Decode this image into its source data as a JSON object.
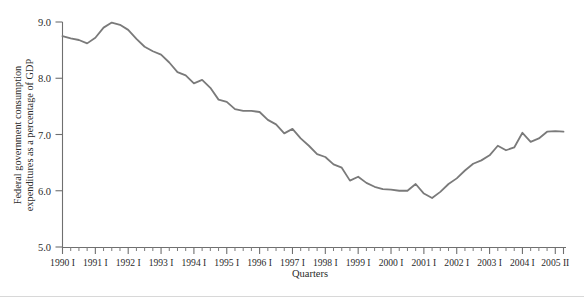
{
  "chart_data": {
    "type": "line",
    "title": "",
    "xlabel": "Quarters",
    "ylabel": "Federal government consumption expenditures as a percentage of GDP",
    "ylabel_line1": "Federal government consumption",
    "ylabel_line2": "expenditures as a percentage of GDP",
    "ylim": [
      5.0,
      9.0
    ],
    "ytick_labels": [
      "5.0",
      "6.0",
      "7.0",
      "8.0",
      "9.0"
    ],
    "ytick_values": [
      5.0,
      6.0,
      7.0,
      8.0,
      9.0
    ],
    "grid": false,
    "legend": "none",
    "line_color": "#7a7a7a",
    "axis_color": "#6f6f6f",
    "xtick_major_labels": [
      "1990 I",
      "1991 I",
      "1992 I",
      "1993 I",
      "1994 I",
      "1995 I",
      "1996 I",
      "1997 I",
      "1998 I",
      "1999 I",
      "2000 I",
      "2001 I",
      "2002 I",
      "2003 I",
      "2004 I",
      "2005 II"
    ],
    "x": [
      "1990 I",
      "1990 II",
      "1990 III",
      "1990 IV",
      "1991 I",
      "1991 II",
      "1991 III",
      "1991 IV",
      "1992 I",
      "1992 II",
      "1992 III",
      "1992 IV",
      "1993 I",
      "1993 II",
      "1993 III",
      "1993 IV",
      "1994 I",
      "1994 II",
      "1994 III",
      "1994 IV",
      "1995 I",
      "1995 II",
      "1995 III",
      "1995 IV",
      "1996 I",
      "1996 II",
      "1996 III",
      "1996 IV",
      "1997 I",
      "1997 II",
      "1997 III",
      "1997 IV",
      "1998 I",
      "1998 II",
      "1998 III",
      "1998 IV",
      "1999 I",
      "1999 II",
      "1999 III",
      "1999 IV",
      "2000 I",
      "2000 II",
      "2000 III",
      "2000 IV",
      "2001 I",
      "2001 II",
      "2001 III",
      "2001 IV",
      "2002 I",
      "2002 II",
      "2002 III",
      "2002 IV",
      "2003 I",
      "2003 II",
      "2003 III",
      "2003 IV",
      "2004 I",
      "2004 II",
      "2004 III",
      "2004 IV",
      "2005 I",
      "2005 II"
    ],
    "values": [
      8.75,
      8.71,
      8.68,
      8.62,
      8.72,
      8.9,
      8.99,
      8.95,
      8.86,
      8.7,
      8.56,
      8.48,
      8.42,
      8.28,
      8.11,
      8.05,
      7.91,
      7.97,
      7.83,
      7.62,
      7.58,
      7.45,
      7.42,
      7.42,
      7.4,
      7.26,
      7.18,
      7.02,
      7.1,
      6.93,
      6.8,
      6.65,
      6.6,
      6.47,
      6.41,
      6.18,
      6.25,
      6.14,
      6.07,
      6.03,
      6.02,
      6.0,
      6.0,
      6.12,
      5.95,
      5.87,
      5.98,
      6.12,
      6.22,
      6.36,
      6.48,
      6.54,
      6.63,
      6.8,
      6.72,
      6.77,
      7.03,
      6.87,
      6.93,
      7.05,
      7.06,
      7.05
    ]
  }
}
